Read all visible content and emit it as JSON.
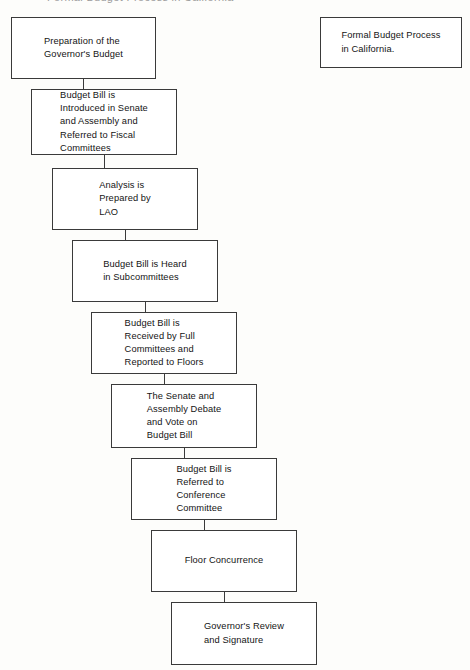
{
  "document": {
    "title": "Formal Budget Process in California",
    "clipped_header_text": "Formal Budget Process in California"
  },
  "title_box": {
    "name": "chart-title-box",
    "text": "Formal Budget Process\nin California.",
    "x": 320,
    "y": 17,
    "w": 142,
    "h": 51
  },
  "flow": {
    "type": "flowchart",
    "orientation": "top-to-bottom-cascading-right",
    "border_color": "#3a3a3a",
    "fill_color": "#ffffff",
    "nodes": [
      {
        "id": "preparation-of-governors-budget",
        "text": "Preparation of the\nGovernor's Budget",
        "x": 11,
        "y": 17,
        "w": 145,
        "h": 62
      },
      {
        "id": "budget-bill-introduced",
        "text": "Budget Bill is\nIntroduced in Senate\nand Assembly and\nReferred to Fiscal\nCommittees",
        "x": 31,
        "y": 89,
        "w": 146,
        "h": 66
      },
      {
        "id": "analysis-prepared-by-lao",
        "text": "Analysis is\nPrepared by\nLAO",
        "x": 52,
        "y": 168,
        "w": 146,
        "h": 62
      },
      {
        "id": "budget-bill-heard-subcommittees",
        "text": "Budget Bill is Heard\nin Subcommittees",
        "x": 72,
        "y": 240,
        "w": 146,
        "h": 62
      },
      {
        "id": "budget-bill-received-full-committees",
        "text": "Budget Bill is\nReceived by Full\nCommittees and\nReported to Floors",
        "x": 91,
        "y": 312,
        "w": 146,
        "h": 62
      },
      {
        "id": "senate-assembly-debate-vote",
        "text": "The Senate and\nAssembly Debate\nand Vote on\nBudget Bill",
        "x": 111,
        "y": 384,
        "w": 146,
        "h": 64
      },
      {
        "id": "budget-bill-referred-conference",
        "text": "Budget Bill is\nReferred to\nConference\nCommittee",
        "x": 131,
        "y": 458,
        "w": 146,
        "h": 62
      },
      {
        "id": "floor-concurrence",
        "text": "Floor Concurrence",
        "x": 151,
        "y": 530,
        "w": 146,
        "h": 62
      },
      {
        "id": "governors-review-signature",
        "text": "Governor's Review\nand Signature",
        "x": 171,
        "y": 602,
        "w": 146,
        "h": 63
      }
    ],
    "connectors": [
      {
        "id": "connector-1-2",
        "from": "preparation-of-governors-budget",
        "to": "budget-bill-introduced",
        "x": 83,
        "y": 79,
        "h": 10
      },
      {
        "id": "connector-2-3",
        "from": "budget-bill-introduced",
        "to": "analysis-prepared-by-lao",
        "x": 104,
        "y": 155,
        "h": 13
      },
      {
        "id": "connector-3-4",
        "from": "analysis-prepared-by-lao",
        "to": "budget-bill-heard-subcommittees",
        "x": 125,
        "y": 230,
        "h": 10
      },
      {
        "id": "connector-4-5",
        "from": "budget-bill-heard-subcommittees",
        "to": "budget-bill-received-full-committees",
        "x": 145,
        "y": 302,
        "h": 10
      },
      {
        "id": "connector-5-6",
        "from": "budget-bill-received-full-committees",
        "to": "senate-assembly-debate-vote",
        "x": 164,
        "y": 374,
        "h": 10
      },
      {
        "id": "connector-6-7",
        "from": "senate-assembly-debate-vote",
        "to": "budget-bill-referred-conference",
        "x": 184,
        "y": 448,
        "h": 10
      },
      {
        "id": "connector-7-8",
        "from": "budget-bill-referred-conference",
        "to": "floor-concurrence",
        "x": 204,
        "y": 520,
        "h": 10
      },
      {
        "id": "connector-8-9",
        "from": "floor-concurrence",
        "to": "governors-review-signature",
        "x": 224,
        "y": 592,
        "h": 10
      }
    ]
  }
}
